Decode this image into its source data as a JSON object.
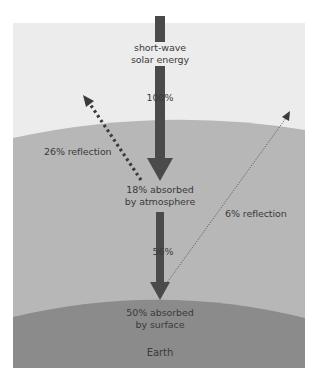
{
  "diagram": {
    "colors": {
      "space": "#ececec",
      "atmosphere": "#b5b5b5",
      "atmosphere_lower": "#bdbdbd",
      "earth": "#8a8a8a",
      "arrow": "#4a4a4a",
      "text": "#3a3a3a"
    },
    "labels": {
      "incoming_line1": "short-wave",
      "incoming_line2": "solar energy",
      "incoming_percent": "100%",
      "reflection_atmosphere": "26% reflection",
      "absorbed_atmosphere_line1": "18% absorbed",
      "absorbed_atmosphere_line2": "by atmosphere",
      "transmitted_percent": "56%",
      "reflection_surface": "6% reflection",
      "absorbed_surface_line1": "50% absorbed",
      "absorbed_surface_line2": "by surface",
      "earth": "Earth"
    },
    "flows": [
      {
        "name": "incoming solar energy",
        "value": 100,
        "unit": "%"
      },
      {
        "name": "reflection by atmosphere",
        "value": 26,
        "unit": "%"
      },
      {
        "name": "absorbed by atmosphere",
        "value": 18,
        "unit": "%"
      },
      {
        "name": "transmitted to surface",
        "value": 56,
        "unit": "%"
      },
      {
        "name": "reflection by surface",
        "value": 6,
        "unit": "%"
      },
      {
        "name": "absorbed by surface",
        "value": 50,
        "unit": "%"
      }
    ]
  }
}
